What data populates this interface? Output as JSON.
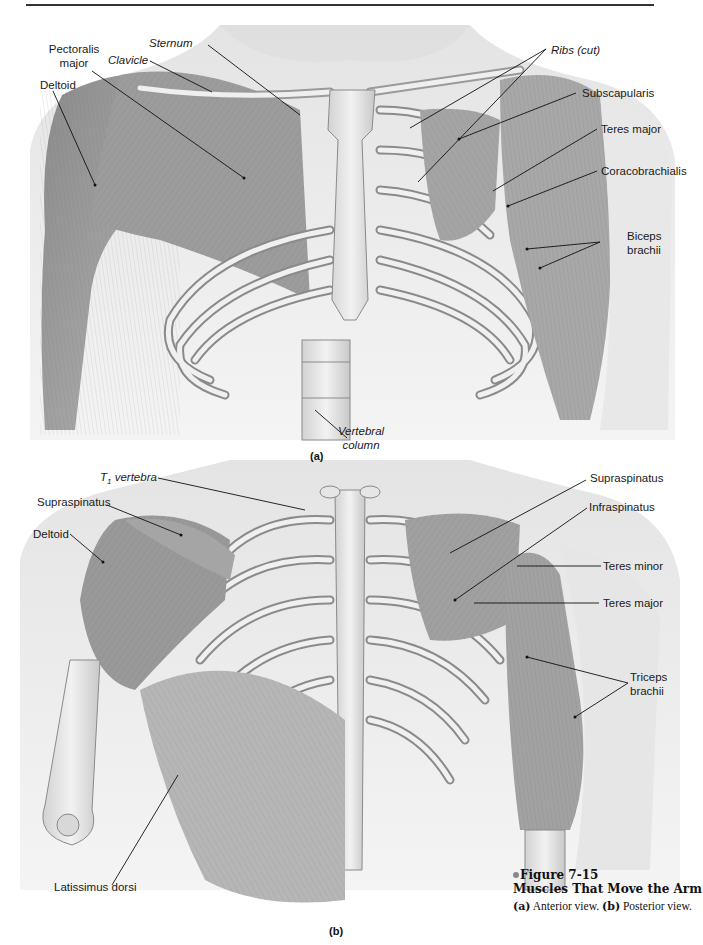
{
  "figure": {
    "number": "Figure 7-15",
    "title": "Muscles That Move the Arm",
    "caption_a_key": "(a)",
    "caption_a_text": " Anterior view. ",
    "caption_b_key": "(b)",
    "caption_b_text": " Posterior view.",
    "accent_dot_color": "#888888"
  },
  "panel_a": {
    "label": "(a)",
    "view": "Anterior view",
    "labels": {
      "pectoralis_major_1": "Pectoralis",
      "pectoralis_major_2": "major",
      "sternum": "Sternum",
      "clavicle": "Clavicle",
      "deltoid": "Deltoid",
      "ribs_cut": "Ribs (cut)",
      "subscapularis": "Subscapularis",
      "teres_major": "Teres major",
      "coracobrachialis": "Coracobrachialis",
      "biceps_brachii_1": "Biceps",
      "biceps_brachii_2": "brachii",
      "vertebral_column_1": "Vertebral",
      "vertebral_column_2": "column"
    }
  },
  "panel_b": {
    "label": "(b)",
    "view": "Posterior view",
    "labels": {
      "t1_vertebra_T": "T",
      "t1_vertebra_sub": "1",
      "t1_vertebra_word": "vertebra",
      "supraspinatus_left": "Supraspinatus",
      "supraspinatus_right": "Supraspinatus",
      "deltoid": "Deltoid",
      "infraspinatus": "Infraspinatus",
      "teres_minor": "Teres minor",
      "teres_major": "Teres major",
      "triceps_brachii_1": "Triceps",
      "triceps_brachii_2": "brachii",
      "latissimus_dorsi": "Latissimus dorsi"
    }
  }
}
